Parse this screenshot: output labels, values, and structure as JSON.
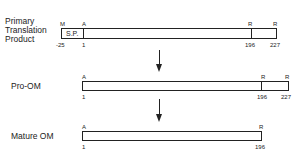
{
  "diagram": {
    "rows": [
      {
        "label_lines": [
          "Primary",
          "Translation",
          "Product"
        ],
        "top_markers": [
          "M",
          "A",
          "R",
          "R"
        ],
        "bottom_numbers": [
          "-25",
          "1",
          "196",
          "227"
        ],
        "segment_label": "S.P."
      },
      {
        "label_lines": [
          "Pro-OM"
        ],
        "top_markers": [
          "A",
          "R",
          "R"
        ],
        "bottom_numbers": [
          "1",
          "196",
          "227"
        ]
      },
      {
        "label_lines": [
          "Mature OM"
        ],
        "top_markers": [
          "A",
          "R"
        ],
        "bottom_numbers": [
          "1",
          "196"
        ]
      }
    ],
    "arrows": [
      "processing-step-1",
      "processing-step-2"
    ]
  }
}
